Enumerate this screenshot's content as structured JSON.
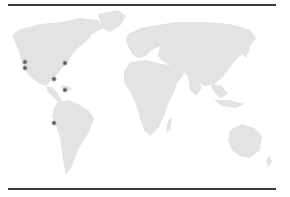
{
  "map": {
    "type": "world-map",
    "land_color": "#e3e3e3",
    "marker_color": "#5a5a5a",
    "rule_color": "#3a3a3a",
    "markers": [
      {
        "region": "US West Coast (north)",
        "x": 25,
        "y": 62
      },
      {
        "region": "US West Coast (south)",
        "x": 25,
        "y": 68
      },
      {
        "region": "US East Coast",
        "x": 65,
        "y": 63
      },
      {
        "region": "Gulf of Mexico / Texas",
        "x": 54,
        "y": 79
      },
      {
        "region": "Caribbean",
        "x": 65,
        "y": 90
      },
      {
        "region": "Ecuador / Peru",
        "x": 54,
        "y": 123
      }
    ]
  }
}
